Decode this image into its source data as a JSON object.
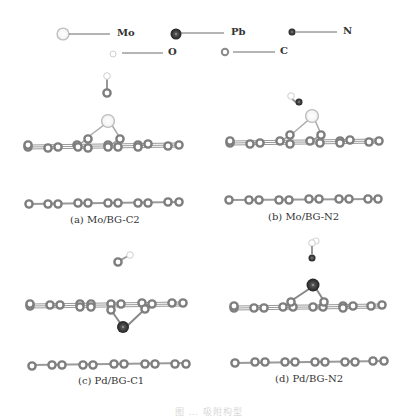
{
  "legend": {
    "items": [
      {
        "element": "Mo",
        "label": "Mo",
        "color": "#ffffff",
        "stroke": "#b8b8b8",
        "size": "large"
      },
      {
        "element": "Pb",
        "label": "Pb",
        "color": "#3a3a3a",
        "stroke": "#222222",
        "size": "large"
      },
      {
        "element": "N",
        "label": "N",
        "color": "#3a3a3a",
        "stroke": "#222222",
        "size": "small"
      },
      {
        "element": "O",
        "label": "O",
        "color": "#ffffff",
        "stroke": "#c8c8c8",
        "size": "small"
      },
      {
        "element": "C",
        "label": "C",
        "color": "#9a9a9a",
        "stroke": "#777777",
        "size": "small"
      }
    ]
  },
  "panels": [
    {
      "id": "a",
      "caption": "(a) Mo/BG-C2",
      "metal": "Mo",
      "adsorbate": "CO (O top, C bottom)"
    },
    {
      "id": "b",
      "caption": "(b) Mo/BG-N2",
      "metal": "Mo",
      "adsorbate": "NO (O top, N bottom)"
    },
    {
      "id": "c",
      "caption": "(c) Pd/BG-C1",
      "metal": "Pd",
      "adsorbate": "CO (tilted)"
    },
    {
      "id": "d",
      "caption": "(d) Pd/BG-N2",
      "metal": "Pd",
      "adsorbate": "NO (O top, N bottom)"
    }
  ],
  "figure_caption": "图 … 吸附构型"
}
